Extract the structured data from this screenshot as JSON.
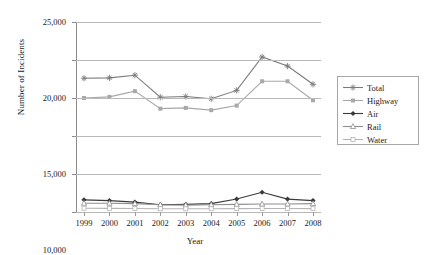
{
  "chart_data": {
    "type": "line",
    "title": "",
    "xlabel": "Year",
    "ylabel": "Number of Incidents",
    "categories": [
      "1999",
      "2000",
      "2001",
      "2002",
      "2003",
      "2004",
      "2005",
      "2006",
      "2007",
      "2008"
    ],
    "x": [
      1999,
      2000,
      2001,
      2002,
      2003,
      2004,
      2005,
      2006,
      2007,
      2008
    ],
    "ylim": [
      0,
      25000
    ],
    "ytick_labels": [
      "0",
      "5,000",
      "10,000",
      "15,000",
      "20,000",
      "25,000"
    ],
    "ytick_values": [
      0,
      5000,
      10000,
      15000,
      20000,
      25000
    ],
    "grid": "horizontal",
    "legend_position": "right",
    "series": [
      {
        "name": "Total",
        "color": "#7a7a7a",
        "marker": "asterisk",
        "values": [
          17600,
          17650,
          18000,
          15100,
          15200,
          14900,
          16000,
          20400,
          19200,
          16800
        ]
      },
      {
        "name": "Highway",
        "color": "#a8a8a8",
        "marker": "square-filled",
        "values": [
          15000,
          15150,
          15900,
          13600,
          13700,
          13400,
          14000,
          17200,
          17200,
          14700
        ]
      },
      {
        "name": "Air",
        "color": "#3a3a3a",
        "marker": "diamond-filled",
        "values": [
          1600,
          1500,
          1300,
          950,
          1000,
          1100,
          1700,
          2600,
          1700,
          1500
        ]
      },
      {
        "name": "Rail",
        "color": "#8e8e8e",
        "marker": "triangle-open",
        "values": [
          1150,
          1150,
          1100,
          950,
          900,
          950,
          1000,
          1050,
          1050,
          1100
        ]
      },
      {
        "name": "Water",
        "color": "#b5b5b5",
        "marker": "square-open",
        "values": [
          500,
          480,
          460,
          430,
          420,
          430,
          450,
          470,
          460,
          450
        ]
      }
    ]
  },
  "legend": {
    "items": [
      {
        "label": "Total"
      },
      {
        "label": "Highway"
      },
      {
        "label": "Air"
      },
      {
        "label": "Rail"
      },
      {
        "label": "Water"
      }
    ]
  }
}
